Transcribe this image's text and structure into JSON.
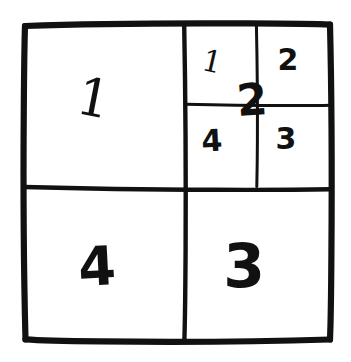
{
  "figure": {
    "style": "hand-drawn ink on white paper",
    "ink_color": "#111111",
    "background_color": "#ffffff"
  },
  "outer_square": {
    "label": "outer-square",
    "left": 24,
    "top": 24,
    "right": 331,
    "bottom": 339
  },
  "dividers": {
    "vertical_midline_x": 185,
    "horizontal_midline_y": 189,
    "sub_vertical_x": 257,
    "sub_horizontal_y": 105,
    "sub_vertical_overshoot_bottom": 186
  },
  "quadrants": [
    {
      "name": "quadrant-top-left",
      "label": "1",
      "position": "top-left"
    },
    {
      "name": "quadrant-top-right",
      "label": "2",
      "position": "top-right"
    },
    {
      "name": "quadrant-bottom-right",
      "label": "3",
      "position": "bottom-right"
    },
    {
      "name": "quadrant-bottom-left",
      "label": "4",
      "position": "bottom-left"
    }
  ],
  "subquadrants": [
    {
      "name": "subquadrant-top-left",
      "label": "1",
      "position": "top-left"
    },
    {
      "name": "subquadrant-top-right",
      "label": "2",
      "position": "top-right"
    },
    {
      "name": "subquadrant-bottom-right",
      "label": "3",
      "position": "bottom-right"
    },
    {
      "name": "subquadrant-bottom-left",
      "label": "4",
      "position": "bottom-left"
    }
  ],
  "overlay": {
    "name": "parent-quadrant-label",
    "label": "2",
    "description": "large numeral overlaid at centre of the subdivided top-right quadrant"
  }
}
